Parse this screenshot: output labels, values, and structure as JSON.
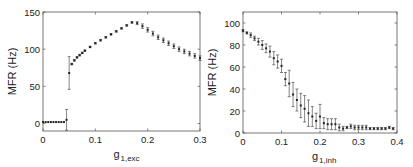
{
  "chart_data": [
    {
      "type": "scatter",
      "title": "",
      "xlabel": "g_1,exc",
      "xlabel_main": "g",
      "xlabel_sub": "1,exc",
      "ylabel": "MFR (Hz)",
      "xlim": [
        0,
        0.3
      ],
      "ylim": [
        -10,
        150
      ],
      "xticks": [
        "0",
        "0.1",
        "0.2",
        "0.3"
      ],
      "yticks": [
        "0",
        "50",
        "100",
        "150"
      ],
      "grid": false,
      "series": [
        {
          "name": "MFR",
          "x": [
            0,
            0.005,
            0.01,
            0.015,
            0.02,
            0.025,
            0.03,
            0.035,
            0.04,
            0.045,
            0.05,
            0.055,
            0.06,
            0.065,
            0.07,
            0.075,
            0.08,
            0.09,
            0.1,
            0.11,
            0.12,
            0.13,
            0.14,
            0.15,
            0.16,
            0.17,
            0.18,
            0.19,
            0.2,
            0.21,
            0.22,
            0.23,
            0.24,
            0.25,
            0.26,
            0.27,
            0.28,
            0.29,
            0.3
          ],
          "y": [
            2,
            2,
            2,
            2,
            2,
            2,
            2,
            2,
            2,
            5,
            68,
            80,
            85,
            89,
            92,
            95,
            98,
            103,
            108,
            112,
            116,
            120,
            124,
            128,
            132,
            136,
            135,
            131,
            126,
            121,
            116,
            112,
            108,
            104,
            100,
            97,
            94,
            91,
            88
          ],
          "err": [
            0,
            0,
            0,
            0,
            0,
            0,
            0,
            0,
            0,
            14,
            22,
            1,
            1,
            1,
            1,
            1,
            1,
            1,
            1,
            1,
            1,
            1,
            1,
            1,
            1,
            1,
            2,
            3,
            3,
            3,
            3,
            3,
            3,
            3,
            3,
            3,
            3,
            3,
            3
          ]
        }
      ]
    },
    {
      "type": "scatter",
      "title": "",
      "xlabel": "g_1,inh",
      "xlabel_main": "g",
      "xlabel_sub": "1,inh",
      "ylabel": "MFR (Hz)",
      "xlim": [
        0,
        0.4
      ],
      "ylim": [
        0,
        110
      ],
      "xticks": [
        "0",
        "0.1",
        "0.2",
        "0.3",
        "0.4"
      ],
      "yticks": [
        "0",
        "20",
        "40",
        "60",
        "80",
        "100"
      ],
      "grid": false,
      "series": [
        {
          "name": "MFR",
          "x": [
            0,
            0.01,
            0.02,
            0.03,
            0.04,
            0.05,
            0.06,
            0.07,
            0.08,
            0.09,
            0.1,
            0.11,
            0.12,
            0.13,
            0.14,
            0.15,
            0.16,
            0.17,
            0.18,
            0.19,
            0.2,
            0.21,
            0.22,
            0.23,
            0.24,
            0.25,
            0.26,
            0.27,
            0.28,
            0.29,
            0.3,
            0.31,
            0.32,
            0.33,
            0.34,
            0.35,
            0.36,
            0.37,
            0.38,
            0.39
          ],
          "y": [
            93,
            91,
            89,
            86,
            83,
            80,
            77,
            74,
            68,
            65,
            61,
            49,
            45,
            35,
            30,
            25,
            22,
            18,
            15,
            11,
            15,
            9,
            8,
            8,
            8,
            5,
            4,
            5,
            6,
            5,
            5,
            5,
            5,
            4,
            4,
            4,
            4,
            4,
            5,
            4
          ],
          "err": [
            1,
            1,
            2,
            2,
            3,
            4,
            4,
            5,
            6,
            6,
            6,
            6,
            12,
            11,
            10,
            11,
            12,
            12,
            9,
            7,
            11,
            5,
            5,
            5,
            5,
            3,
            2,
            1,
            2,
            2,
            2,
            2,
            2,
            1,
            1,
            1,
            1,
            1,
            1,
            1
          ]
        }
      ]
    }
  ]
}
